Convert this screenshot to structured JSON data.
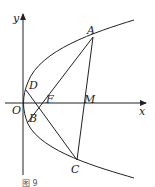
{
  "figure": {
    "caption": "图 9",
    "axes": {
      "x_label": "x",
      "y_label": "y",
      "origin_label": "O"
    },
    "points": {
      "A": "A",
      "B": "B",
      "C": "C",
      "D": "D",
      "F": "F",
      "M": "M"
    }
  }
}
